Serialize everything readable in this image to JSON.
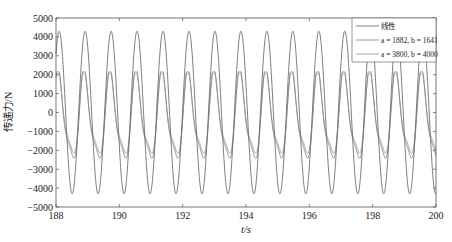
{
  "chart_data": {
    "type": "line",
    "title": "",
    "xlabel": "t/s",
    "ylabel": "传递力/N",
    "xlim": [
      188,
      200
    ],
    "ylim": [
      -5000,
      5000
    ],
    "xticks": [
      188,
      190,
      192,
      194,
      196,
      198,
      200
    ],
    "yticks": [
      5000,
      4000,
      3000,
      2000,
      1000,
      0,
      -1000,
      -2000,
      -3000,
      -4000,
      -5000
    ],
    "grid": false,
    "legend_position": "upper right",
    "period_s": 0.82,
    "first_peak_s": 188.1,
    "series": [
      {
        "name": "线性",
        "legend_label": "线性",
        "peak": 4300,
        "trough": -4300,
        "color": "#6e6e6e",
        "shape": "sine"
      },
      {
        "name": "a = 1882, b = 1641",
        "legend_label": "a = 1882, b = 1641",
        "peak": 2150,
        "trough": -2950,
        "color": "#8a8a8a",
        "shape": "skewed"
      },
      {
        "name": "a = 3800, b = 4000",
        "legend_label": "a = 3800, b = 4000",
        "peak": 2050,
        "trough": -2650,
        "color": "#a0a0a0",
        "shape": "skewed"
      }
    ]
  }
}
